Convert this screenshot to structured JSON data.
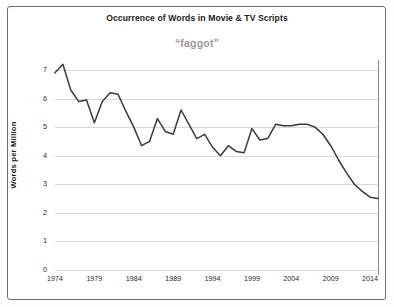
{
  "chart_data": {
    "type": "line",
    "title": "Occurrence of Words in Movie & TV Scripts",
    "subtitle": "“faggot”",
    "xlabel": "",
    "ylabel": "Words per Million",
    "xlim": [
      1974,
      2015
    ],
    "ylim": [
      0,
      7
    ],
    "grid": true,
    "legend": "none",
    "line_color": "#3a3a3a",
    "grid_color": "#d9d9d9",
    "subtitle_color": "#9a9a9a",
    "ytick_labels": [
      "7",
      "6",
      "5",
      "4",
      "3",
      "2",
      "1",
      "0"
    ],
    "ytick_values": [
      7,
      6,
      5,
      4,
      3,
      2,
      1,
      0
    ],
    "xtick_labels": [
      "1974",
      "1979",
      "1984",
      "1989",
      "1994",
      "1999",
      "2004",
      "2009",
      "2014"
    ],
    "xtick_values": [
      1974,
      1979,
      1984,
      1989,
      1994,
      1999,
      2004,
      2009,
      2014
    ],
    "x": [
      1974,
      1975,
      1976,
      1977,
      1978,
      1979,
      1980,
      1981,
      1982,
      1983,
      1984,
      1985,
      1986,
      1987,
      1988,
      1989,
      1990,
      1991,
      1992,
      1993,
      1994,
      1995,
      1996,
      1997,
      1998,
      1999,
      2000,
      2001,
      2002,
      2003,
      2004,
      2005,
      2006,
      2007,
      2008,
      2009,
      2010,
      2011,
      2012,
      2013,
      2014,
      2015
    ],
    "values": [
      6.9,
      7.2,
      6.3,
      5.9,
      5.95,
      5.15,
      5.9,
      6.2,
      6.15,
      5.55,
      5.0,
      4.35,
      4.5,
      5.3,
      4.85,
      4.75,
      5.6,
      5.1,
      4.6,
      4.75,
      4.3,
      4.0,
      4.35,
      4.15,
      4.1,
      4.95,
      4.55,
      4.6,
      5.1,
      5.05,
      5.05,
      5.1,
      5.1,
      5.0,
      4.75,
      4.35,
      3.85,
      3.4,
      3.0,
      2.75,
      2.55,
      2.5
    ],
    "series": [
      {
        "name": "faggot",
        "values": [
          6.9,
          7.2,
          6.3,
          5.9,
          5.95,
          5.15,
          5.9,
          6.2,
          6.15,
          5.55,
          5.0,
          4.35,
          4.5,
          5.3,
          4.85,
          4.75,
          5.6,
          5.1,
          4.6,
          4.75,
          4.3,
          4.0,
          4.35,
          4.15,
          4.1,
          4.95,
          4.55,
          4.6,
          5.1,
          5.05,
          5.05,
          5.1,
          5.1,
          5.0,
          4.75,
          4.35,
          3.85,
          3.4,
          3.0,
          2.75,
          2.55,
          2.5
        ]
      }
    ]
  }
}
